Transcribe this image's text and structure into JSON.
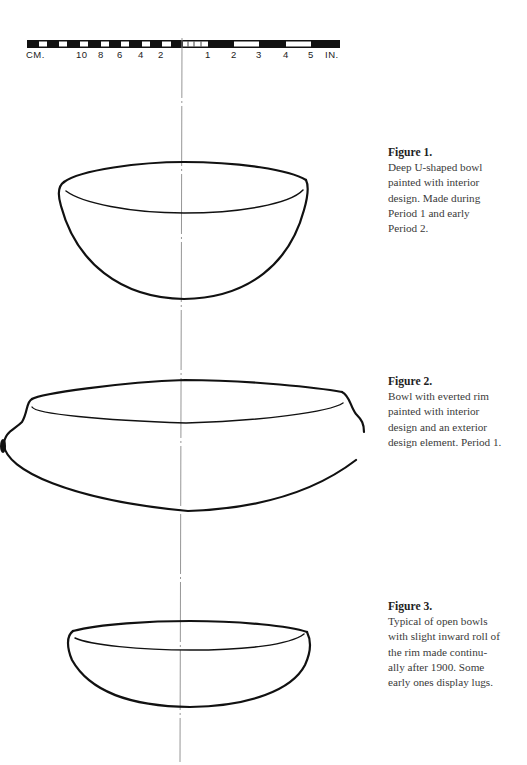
{
  "scale_bar": {
    "cm_label": "CM.",
    "cm_ticks": [
      "10",
      "8",
      "6",
      "4",
      "2"
    ],
    "in_ticks": [
      "1",
      "2",
      "3",
      "4",
      "5"
    ],
    "in_label": "IN."
  },
  "figures": [
    {
      "title": "Figure 1.",
      "lines": [
        "Deep U-shaped bowl",
        "painted with interior",
        "design. Made during",
        "Period 1 and early",
        "Period 2."
      ]
    },
    {
      "title": "Figure 2.",
      "lines": [
        "Bowl with everted rim",
        "painted with interior",
        "design and an exterior",
        "design element. Period 1."
      ]
    },
    {
      "title": "Figure 3.",
      "lines": [
        "Typical of open bowls",
        "with slight inward roll of",
        "the rim made continu-",
        "ally after 1900. Some",
        "early ones display lugs."
      ]
    }
  ],
  "colors": {
    "ink": "#111111",
    "centerline": "#8a8a8a",
    "caption_text": "#3a3a3a"
  }
}
